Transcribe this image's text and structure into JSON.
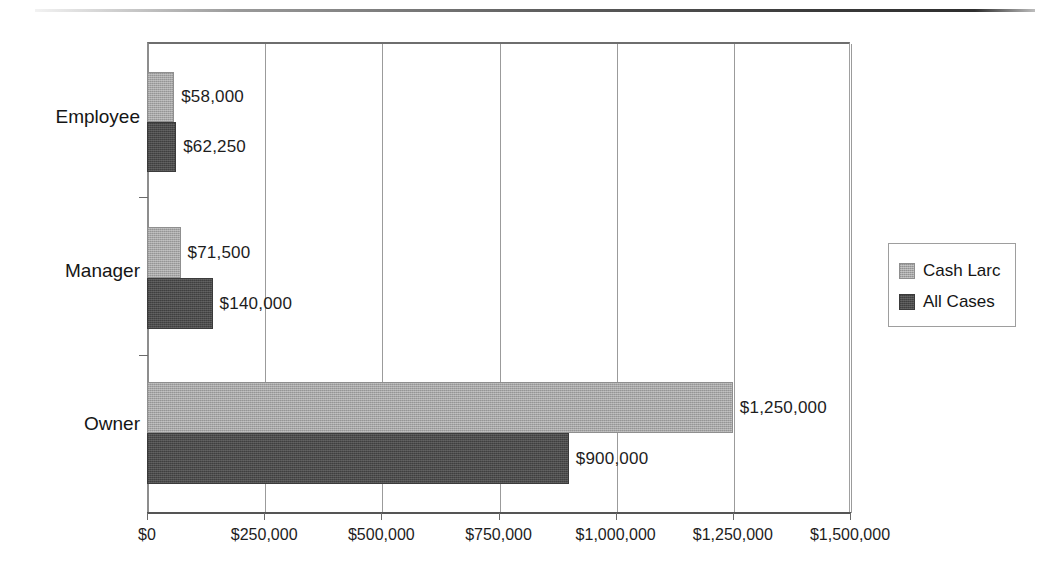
{
  "chart_data": {
    "type": "bar",
    "orientation": "horizontal",
    "title": "",
    "subtitle": "",
    "xlabel": "",
    "ylabel": "",
    "categories": [
      "Employee",
      "Manager",
      "Owner"
    ],
    "series": [
      {
        "name": "Cash Larc",
        "color": "#a6a6a6",
        "values": [
          58000,
          71500,
          1250000
        ],
        "data_labels": [
          "$58,000",
          "$71,500",
          "$1,250,000"
        ]
      },
      {
        "name": "All Cases",
        "color": "#4b4b4b",
        "values": [
          62250,
          140000,
          900000
        ],
        "data_labels": [
          "$62,250",
          "$140,000",
          "$900,000"
        ]
      }
    ],
    "xlim": [
      0,
      1500000
    ],
    "xticks": [
      0,
      250000,
      500000,
      750000,
      1000000,
      1250000,
      1500000
    ],
    "xtick_labels": [
      "$0",
      "$250,000",
      "$500,000",
      "$750,000",
      "$1,000,000",
      "$1,250,000",
      "$1,500,000"
    ],
    "grid": true,
    "grid_axis": "x",
    "legend_position": "right"
  },
  "legend": {
    "entries": [
      {
        "label": "Cash Larc"
      },
      {
        "label": "All Cases"
      }
    ]
  },
  "axis": {
    "category_labels": [
      "Employee",
      "Manager",
      "Owner"
    ],
    "tick_labels": [
      "$0",
      "$250,000",
      "$500,000",
      "$750,000",
      "$1,000,000",
      "$1,250,000",
      "$1,500,000"
    ]
  },
  "bars": [
    {
      "category": "Employee",
      "series": "Cash Larc",
      "label": "$58,000"
    },
    {
      "category": "Employee",
      "series": "All Cases",
      "label": "$62,250"
    },
    {
      "category": "Manager",
      "series": "Cash Larc",
      "label": "$71,500"
    },
    {
      "category": "Manager",
      "series": "All Cases",
      "label": "$140,000"
    },
    {
      "category": "Owner",
      "series": "Cash Larc",
      "label": "$1,250,000"
    },
    {
      "category": "Owner",
      "series": "All Cases",
      "label": "$900,000"
    }
  ]
}
